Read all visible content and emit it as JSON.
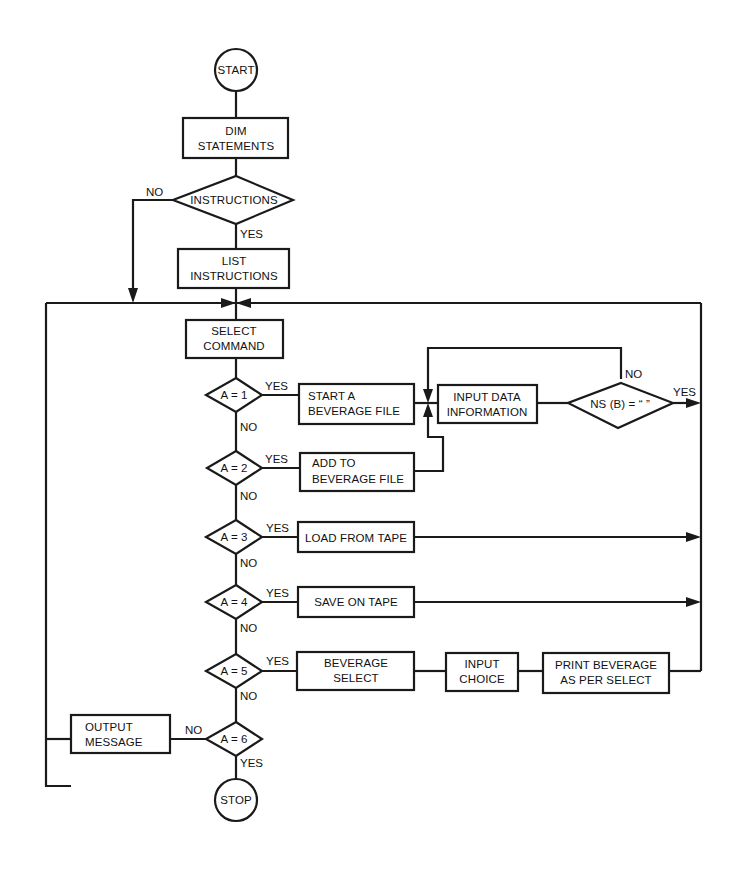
{
  "diagram": {
    "type": "flowchart",
    "nodes": {
      "start": {
        "label": "START",
        "shape": "circle"
      },
      "dim": {
        "label_lines": [
          "DIM",
          "STATEMENTS"
        ],
        "shape": "rect"
      },
      "instructions_q": {
        "label": "INSTRUCTIONS",
        "shape": "diamond"
      },
      "list_instructions": {
        "label_lines": [
          "LIST",
          "INSTRUCTIONS"
        ],
        "shape": "rect"
      },
      "select_command": {
        "label_lines": [
          "SELECT",
          "COMMAND"
        ],
        "shape": "rect"
      },
      "a1": {
        "label": "A = 1",
        "shape": "diamond"
      },
      "start_file": {
        "label_lines": [
          "START A",
          "BEVERAGE FILE"
        ],
        "shape": "rect"
      },
      "input_data": {
        "label_lines": [
          "INPUT DATA",
          "INFORMATION"
        ],
        "shape": "rect"
      },
      "nsb": {
        "label": "NS (B) = “ ”",
        "shape": "diamond"
      },
      "a2": {
        "label": "A = 2",
        "shape": "diamond"
      },
      "add_file": {
        "label_lines": [
          "ADD TO",
          "BEVERAGE FILE"
        ],
        "shape": "rect"
      },
      "a3": {
        "label": "A = 3",
        "shape": "diamond"
      },
      "load_tape": {
        "label": "LOAD FROM TAPE",
        "shape": "rect"
      },
      "a4": {
        "label": "A = 4",
        "shape": "diamond"
      },
      "save_tape": {
        "label": "SAVE ON TAPE",
        "shape": "rect"
      },
      "a5": {
        "label": "A = 5",
        "shape": "diamond"
      },
      "bev_select": {
        "label_lines": [
          "BEVERAGE",
          "SELECT"
        ],
        "shape": "rect"
      },
      "input_choice": {
        "label_lines": [
          "INPUT",
          "CHOICE"
        ],
        "shape": "rect"
      },
      "print_bev": {
        "label_lines": [
          "PRINT BEVERAGE",
          "AS PER SELECT"
        ],
        "shape": "rect"
      },
      "a6": {
        "label": "A = 6",
        "shape": "diamond"
      },
      "output_message": {
        "label_lines": [
          "OUTPUT",
          "MESSAGE"
        ],
        "shape": "rect"
      },
      "stop": {
        "label": "STOP",
        "shape": "circle"
      }
    },
    "edge_labels": {
      "yes": "YES",
      "no": "NO"
    },
    "edges": [
      {
        "from": "start",
        "to": "dim"
      },
      {
        "from": "dim",
        "to": "instructions_q"
      },
      {
        "from": "instructions_q",
        "to": "list_instructions",
        "label": "YES"
      },
      {
        "from": "instructions_q",
        "to": "main_loop",
        "label": "NO"
      },
      {
        "from": "list_instructions",
        "to": "select_command"
      },
      {
        "from": "select_command",
        "to": "a1"
      },
      {
        "from": "a1",
        "to": "start_file",
        "label": "YES"
      },
      {
        "from": "a1",
        "to": "a2",
        "label": "NO"
      },
      {
        "from": "start_file",
        "to": "input_data"
      },
      {
        "from": "input_data",
        "to": "nsb"
      },
      {
        "from": "nsb",
        "to": "input_data",
        "label": "NO"
      },
      {
        "from": "nsb",
        "to": "main_loop",
        "label": "YES"
      },
      {
        "from": "a2",
        "to": "add_file",
        "label": "YES"
      },
      {
        "from": "a2",
        "to": "a3",
        "label": "NO"
      },
      {
        "from": "add_file",
        "to": "input_data"
      },
      {
        "from": "a3",
        "to": "load_tape",
        "label": "YES"
      },
      {
        "from": "a3",
        "to": "a4",
        "label": "NO"
      },
      {
        "from": "load_tape",
        "to": "main_loop"
      },
      {
        "from": "a4",
        "to": "save_tape",
        "label": "YES"
      },
      {
        "from": "a4",
        "to": "a5",
        "label": "NO"
      },
      {
        "from": "save_tape",
        "to": "main_loop"
      },
      {
        "from": "a5",
        "to": "bev_select",
        "label": "YES"
      },
      {
        "from": "a5",
        "to": "a6",
        "label": "NO"
      },
      {
        "from": "bev_select",
        "to": "input_choice"
      },
      {
        "from": "input_choice",
        "to": "print_bev"
      },
      {
        "from": "print_bev",
        "to": "main_loop"
      },
      {
        "from": "a6",
        "to": "output_message",
        "label": "NO"
      },
      {
        "from": "a6",
        "to": "stop",
        "label": "YES"
      },
      {
        "from": "output_message",
        "to": "main_loop"
      }
    ]
  }
}
